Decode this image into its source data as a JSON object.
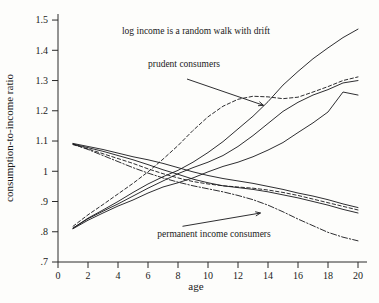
{
  "chart_data": {
    "type": "line",
    "title": "",
    "xlabel": "age",
    "ylabel": "consumption-to-income ratio",
    "xlim": [
      0,
      20.6
    ],
    "ylim": [
      0.7,
      1.52
    ],
    "grid": false,
    "legend": "none",
    "xticks": [
      "0",
      "2",
      "4",
      "6",
      "8",
      "10",
      "12",
      "14",
      "16",
      "18",
      "20"
    ],
    "xtick_values": [
      0,
      2,
      4,
      6,
      8,
      10,
      12,
      14,
      16,
      18,
      20
    ],
    "yticks": [
      ".7",
      ".8",
      ".9",
      "1",
      "1.1",
      "1.2",
      "1.3",
      "1.4",
      "1.5"
    ],
    "ytick_values": [
      0.7,
      0.8,
      0.9,
      1.0,
      1.1,
      1.2,
      1.3,
      1.4,
      1.5
    ],
    "x": [
      1,
      2,
      3,
      4,
      5,
      6,
      7,
      8,
      9,
      10,
      11,
      12,
      13,
      14,
      15,
      16,
      17,
      18,
      19,
      20
    ],
    "series": [
      {
        "name": "prudent-consumer-rising-1",
        "style": "solid",
        "values": [
          0.812,
          0.845,
          0.872,
          0.9,
          0.93,
          0.958,
          0.982,
          1.003,
          1.03,
          1.062,
          1.098,
          1.14,
          1.182,
          1.23,
          1.285,
          1.33,
          1.372,
          1.408,
          1.442,
          1.47
        ]
      },
      {
        "name": "prudent-consumer-rising-2",
        "style": "solid",
        "values": [
          0.812,
          0.843,
          0.868,
          0.892,
          0.918,
          0.944,
          0.968,
          0.992,
          1.012,
          1.03,
          1.052,
          1.082,
          1.118,
          1.158,
          1.198,
          1.228,
          1.252,
          1.27,
          1.292,
          1.3
        ]
      },
      {
        "name": "prudent-consumer-rising-dashed",
        "style": "dashed",
        "values": [
          0.818,
          0.856,
          0.89,
          0.925,
          0.96,
          0.998,
          1.04,
          1.085,
          1.135,
          1.18,
          1.215,
          1.238,
          1.248,
          1.246,
          1.24,
          1.245,
          1.262,
          1.28,
          1.3,
          1.312
        ]
      },
      {
        "name": "prudent-consumer-rising-3",
        "style": "solid",
        "values": [
          0.81,
          0.838,
          0.862,
          0.885,
          0.905,
          0.928,
          0.948,
          0.962,
          0.978,
          0.998,
          1.016,
          1.03,
          1.048,
          1.07,
          1.095,
          1.128,
          1.16,
          1.196,
          1.262,
          1.252
        ]
      },
      {
        "name": "permanent-income-declining-1",
        "style": "solid",
        "values": [
          1.092,
          1.082,
          1.072,
          1.06,
          1.048,
          1.038,
          1.026,
          1.012,
          0.998,
          0.986,
          0.976,
          0.968,
          0.96,
          0.95,
          0.94,
          0.928,
          0.918,
          0.906,
          0.892,
          0.88
        ]
      },
      {
        "name": "permanent-income-declining-2",
        "style": "solid",
        "values": [
          1.09,
          1.078,
          1.066,
          1.052,
          1.038,
          1.022,
          1.005,
          0.99,
          0.974,
          0.962,
          0.952,
          0.946,
          0.94,
          0.932,
          0.922,
          0.912,
          0.9,
          0.888,
          0.874,
          0.862
        ]
      },
      {
        "name": "permanent-income-declining-dashed",
        "style": "dashed",
        "values": [
          1.088,
          1.074,
          1.058,
          1.042,
          1.026,
          1.008,
          0.992,
          0.978,
          0.966,
          0.958,
          0.952,
          0.948,
          0.944,
          0.938,
          0.93,
          0.92,
          0.908,
          0.896,
          0.884,
          0.872
        ]
      },
      {
        "name": "permanent-income-declining-dashdot",
        "style": "dashdot",
        "values": [
          1.09,
          1.072,
          1.052,
          1.032,
          1.012,
          0.994,
          0.978,
          0.964,
          0.952,
          0.942,
          0.932,
          0.92,
          0.906,
          0.888,
          0.866,
          0.842,
          0.82,
          0.798,
          0.782,
          0.77
        ]
      }
    ],
    "annotations": [
      {
        "text": "log income is a random walk with drift",
        "x": 9.2,
        "y": 1.455
      },
      {
        "text": "prudent consumers",
        "x": 8.4,
        "y": 1.345
      },
      {
        "text": "permanent income consumers",
        "x": 10.4,
        "y": 0.782
      }
    ],
    "arrows": [
      {
        "name": "prudent-consumers-arrow",
        "x1": 8.6,
        "y1": 1.305,
        "x2": 13.7,
        "y2": 1.218
      },
      {
        "name": "permanent-income-consumers-arrow",
        "x1": 8.3,
        "y1": 0.818,
        "x2": 13.5,
        "y2": 0.862
      }
    ]
  }
}
